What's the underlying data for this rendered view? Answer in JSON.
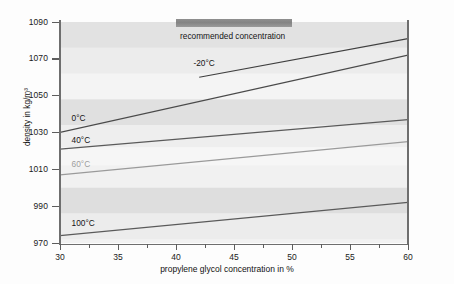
{
  "chart_data": {
    "type": "line",
    "title": "",
    "xlabel": "propylene glycol concentration in %",
    "ylabel": "density in kg/m³",
    "xlim": [
      30,
      60
    ],
    "ylim": [
      970,
      1090
    ],
    "xticks": [
      30,
      35,
      40,
      45,
      50,
      55,
      60
    ],
    "xtick_labels": [
      "30",
      "35",
      "40",
      "45",
      "50",
      "55",
      "60"
    ],
    "yticks": [
      970,
      990,
      1010,
      1030,
      1050,
      1070,
      1090
    ],
    "ytick_labels": [
      "970",
      "990",
      "1010",
      "1030",
      "1050",
      "1070",
      "1090"
    ],
    "grid": false,
    "legend_position": "inline-curve-labels",
    "background_bands": true,
    "series": [
      {
        "name": "-20°C",
        "label": "-20°C",
        "color": "#3f3f3f",
        "x": [
          42,
          60
        ],
        "values": [
          1060,
          1081
        ],
        "label_x": 41.5,
        "label_y": 1068
      },
      {
        "name": "0°C",
        "label": "0°C",
        "color": "#4a4a4a",
        "x": [
          30,
          60
        ],
        "values": [
          1030,
          1072
        ],
        "label_x": 31.0,
        "label_y": 1038
      },
      {
        "name": "40°C",
        "label": "40°C",
        "color": "#5a5a5a",
        "x": [
          30,
          60
        ],
        "values": [
          1021,
          1037
        ],
        "label_x": 31.0,
        "label_y": 1026
      },
      {
        "name": "60°C",
        "label": "60°C",
        "color": "#9a9a9a",
        "x": [
          30,
          60
        ],
        "values": [
          1007,
          1025
        ],
        "label_x": 31.0,
        "label_y": 1013
      },
      {
        "name": "100°C",
        "label": "100°C",
        "color": "#5a5a5a",
        "x": [
          30,
          60
        ],
        "values": [
          974,
          992
        ],
        "label_x": 31.0,
        "label_y": 981
      }
    ],
    "annotations": [
      {
        "name": "recommended-concentration",
        "text": "recommended concentration",
        "x_start": 40,
        "x_end": 50,
        "color": "#848484"
      }
    ]
  }
}
